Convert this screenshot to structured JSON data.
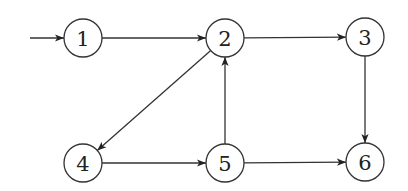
{
  "diagram": {
    "type": "directed-graph",
    "node_radius": 19,
    "stroke_color": "#333333",
    "background": "#ffffff",
    "nodes": [
      {
        "id": "1",
        "label": "1",
        "x": 83,
        "y": 38
      },
      {
        "id": "2",
        "label": "2",
        "x": 225,
        "y": 38
      },
      {
        "id": "3",
        "label": "3",
        "x": 365,
        "y": 37
      },
      {
        "id": "4",
        "label": "4",
        "x": 83,
        "y": 163
      },
      {
        "id": "5",
        "label": "5",
        "x": 225,
        "y": 163
      },
      {
        "id": "6",
        "label": "6",
        "x": 365,
        "y": 162
      }
    ],
    "start_arrow": {
      "from_x": 30,
      "from_y": 38,
      "to": "1"
    },
    "edges": [
      {
        "from": "1",
        "to": "2"
      },
      {
        "from": "2",
        "to": "3"
      },
      {
        "from": "2",
        "to": "4"
      },
      {
        "from": "3",
        "to": "6"
      },
      {
        "from": "4",
        "to": "5"
      },
      {
        "from": "5",
        "to": "2"
      },
      {
        "from": "5",
        "to": "6"
      }
    ]
  }
}
